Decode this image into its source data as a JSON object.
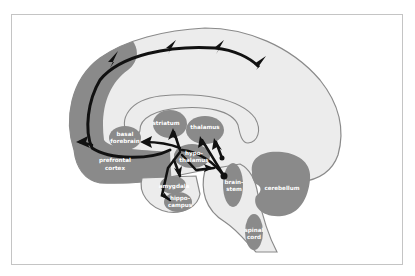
{
  "diagram": {
    "colors": {
      "background": "#ffffff",
      "frame": "#c4c4c4",
      "brain_fill": "#ececec",
      "brain_outline": "#8a8a8a",
      "region_fill": "#8a8a8a",
      "arrow": "#111111",
      "label_text": "#ffffff"
    },
    "regions": {
      "prefrontal_cortex": [
        "prefrontal",
        "cortex"
      ],
      "basal_forebrain": [
        "basal",
        "forebrain"
      ],
      "striatum": [
        "striatum"
      ],
      "thalamus": [
        "thalamus"
      ],
      "hypothalamus": [
        "hypo-",
        "thalamus"
      ],
      "amygdala": [
        "amygdala"
      ],
      "hippocampus": [
        "hippo-",
        "campus"
      ],
      "brainstem": [
        "brain-",
        "stem"
      ],
      "cerebellum": [
        "cerebellum"
      ],
      "spinal_cord": [
        "spinal",
        "cord"
      ]
    }
  }
}
